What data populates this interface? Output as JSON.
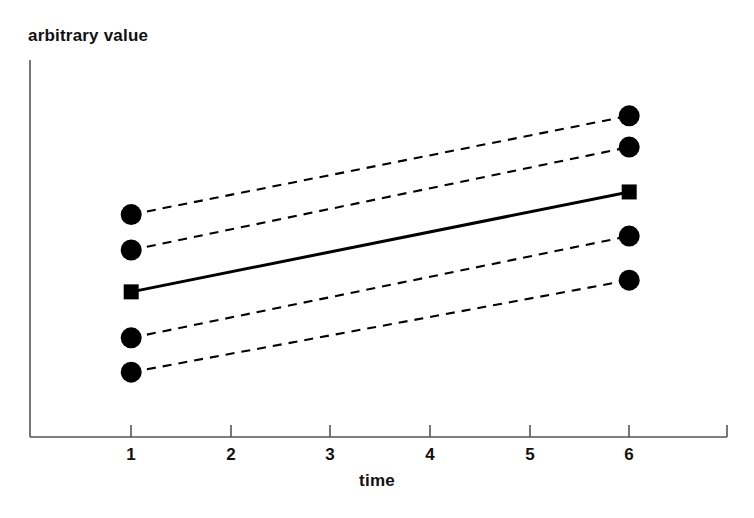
{
  "chart_data": {
    "type": "line",
    "title": "",
    "subtitle": "",
    "xlabel": "time",
    "ylabel": "arbitrary value",
    "x": [
      1,
      6
    ],
    "xlim": [
      0.0,
      6.95
    ],
    "ylim": [
      0,
      100
    ],
    "xticks": [
      1,
      2,
      3,
      4,
      5,
      6
    ],
    "xtick_labels": [
      "1",
      "2",
      "3",
      "4",
      "5",
      "6"
    ],
    "yticks": [],
    "ytick_labels": [],
    "grid": false,
    "legend": null,
    "annotations": [],
    "series": [
      {
        "name": "subject-1",
        "style": "dashed",
        "marker": "circle",
        "color": "#000000",
        "values": [
          59.0,
          85.2
        ]
      },
      {
        "name": "subject-2",
        "style": "dashed",
        "marker": "circle",
        "color": "#000000",
        "values": [
          49.6,
          76.9
        ]
      },
      {
        "name": "subject-3",
        "style": "dashed",
        "marker": "circle",
        "color": "#000000",
        "values": [
          26.3,
          53.3
        ]
      },
      {
        "name": "subject-4",
        "style": "dashed",
        "marker": "circle",
        "color": "#000000",
        "values": [
          17.2,
          41.6
        ]
      },
      {
        "name": "mean",
        "style": "solid",
        "marker": "square",
        "color": "#000000",
        "values": [
          38.5,
          65.0
        ]
      }
    ]
  },
  "axes": {
    "x_axis_name": "time-axis",
    "y_axis_name": "arbitrary-value-axis",
    "axis_color": "#555555"
  },
  "labels": {
    "y_axis_title": "arbitrary value",
    "x_axis_title": "time",
    "x_tick_1": "1",
    "x_tick_2": "2",
    "x_tick_3": "3",
    "x_tick_4": "4",
    "x_tick_5": "5",
    "x_tick_6": "6"
  }
}
